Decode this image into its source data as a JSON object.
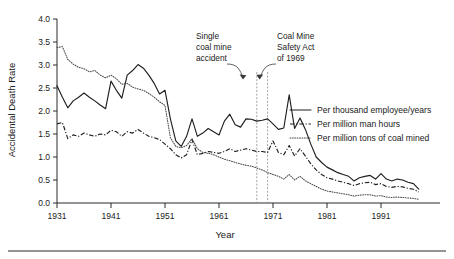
{
  "chart_data": {
    "type": "line",
    "title": "",
    "subtitle": "",
    "xlabel": "Year",
    "ylabel": "Accidental Death Rate",
    "xlim": [
      1931,
      1998
    ],
    "ylim": [
      0.0,
      4.0
    ],
    "grid": false,
    "legend_position": "center-right",
    "x_ticks": [
      1931,
      1941,
      1951,
      1961,
      1971,
      1981,
      1991
    ],
    "x_tick_labels": [
      "1931",
      "1941",
      "1951",
      "1961",
      "1971",
      "1981",
      "1991"
    ],
    "y_ticks": [
      0.0,
      0.5,
      1.0,
      1.5,
      2.0,
      2.5,
      3.0,
      3.5,
      4.0
    ],
    "y_tick_labels": [
      "0.0",
      "0.5",
      "1.0",
      "1.5",
      "2.0",
      "2.5",
      "3.0",
      "3.5",
      "4.0"
    ],
    "x": [
      1931,
      1932,
      1933,
      1934,
      1935,
      1936,
      1937,
      1938,
      1939,
      1940,
      1941,
      1942,
      1943,
      1944,
      1945,
      1946,
      1947,
      1948,
      1949,
      1950,
      1951,
      1952,
      1953,
      1954,
      1955,
      1956,
      1957,
      1958,
      1959,
      1960,
      1961,
      1962,
      1963,
      1964,
      1965,
      1966,
      1967,
      1968,
      1969,
      1970,
      1971,
      1972,
      1973,
      1974,
      1975,
      1976,
      1977,
      1978,
      1979,
      1980,
      1981,
      1982,
      1983,
      1984,
      1985,
      1986,
      1987,
      1988,
      1989,
      1990,
      1991,
      1992,
      1993,
      1994,
      1995,
      1996,
      1997,
      1998
    ],
    "series": [
      {
        "name": "Per thousand employee/years",
        "style": "solid",
        "values": [
          2.55,
          2.3,
          2.07,
          2.22,
          2.3,
          2.39,
          2.3,
          2.22,
          2.13,
          2.05,
          2.65,
          2.45,
          2.28,
          2.78,
          2.88,
          3.01,
          2.93,
          2.78,
          2.6,
          2.37,
          2.45,
          1.83,
          1.35,
          1.23,
          1.45,
          1.83,
          1.45,
          1.52,
          1.62,
          1.55,
          1.48,
          1.78,
          1.93,
          1.7,
          1.65,
          1.83,
          1.82,
          1.78,
          1.8,
          1.83,
          1.72,
          1.6,
          1.63,
          2.35,
          1.62,
          1.85,
          1.6,
          1.28,
          1.0,
          0.88,
          0.78,
          0.72,
          0.66,
          0.62,
          0.58,
          0.48,
          0.55,
          0.58,
          0.6,
          0.52,
          0.64,
          0.52,
          0.48,
          0.52,
          0.5,
          0.45,
          0.42,
          0.3
        ]
      },
      {
        "name": "Per million man hours",
        "style": "dashdot",
        "values": [
          1.72,
          1.75,
          1.4,
          1.48,
          1.45,
          1.52,
          1.48,
          1.45,
          1.5,
          1.48,
          1.58,
          1.55,
          1.45,
          1.55,
          1.52,
          1.6,
          1.52,
          1.45,
          1.42,
          1.38,
          1.28,
          1.18,
          1.05,
          0.98,
          1.05,
          1.38,
          1.05,
          1.08,
          1.12,
          1.1,
          1.08,
          1.12,
          1.18,
          1.12,
          1.15,
          1.18,
          1.15,
          1.12,
          1.12,
          1.1,
          1.35,
          1.1,
          1.05,
          1.25,
          1.02,
          1.18,
          1.02,
          0.85,
          0.72,
          0.62,
          0.55,
          0.52,
          0.48,
          0.45,
          0.42,
          0.38,
          0.42,
          0.44,
          0.45,
          0.4,
          0.42,
          0.36,
          0.34,
          0.36,
          0.35,
          0.32,
          0.3,
          0.24
        ]
      },
      {
        "name": "Per million tons of coal mined",
        "style": "dotted",
        "values": [
          3.38,
          3.4,
          3.12,
          3.02,
          2.95,
          2.92,
          2.85,
          2.88,
          2.78,
          2.72,
          2.78,
          2.7,
          2.58,
          2.6,
          2.52,
          2.48,
          2.45,
          2.38,
          2.3,
          2.2,
          2.12,
          1.42,
          1.23,
          1.2,
          1.25,
          1.4,
          1.18,
          1.1,
          1.08,
          1.05,
          1.0,
          0.95,
          0.92,
          0.88,
          0.85,
          0.82,
          0.8,
          0.76,
          0.72,
          0.66,
          0.62,
          0.58,
          0.52,
          0.62,
          0.5,
          0.58,
          0.48,
          0.42,
          0.36,
          0.3,
          0.26,
          0.24,
          0.22,
          0.2,
          0.18,
          0.15,
          0.17,
          0.18,
          0.18,
          0.15,
          0.16,
          0.13,
          0.12,
          0.13,
          0.12,
          0.11,
          0.1,
          0.08
        ]
      }
    ],
    "annotations": [
      {
        "name": "single-coal-mine-accident",
        "lines": [
          "Single",
          "coal mine",
          "accident"
        ],
        "points_to_year": 1968
      },
      {
        "name": "coal-mine-safety-act",
        "lines": [
          "Coal Mine",
          "Safety Act",
          "of 1969"
        ],
        "points_to_year": 1970
      }
    ],
    "vertical_markers": [
      {
        "name": "marker-1968",
        "year": 1968
      },
      {
        "name": "marker-1970",
        "year": 1970
      }
    ]
  },
  "legend": {
    "entries": [
      {
        "label": "Per thousand employee/years",
        "style": "solid"
      },
      {
        "label": "Per million man hours",
        "style": "dashdot"
      },
      {
        "label": "Per million tons of coal mined",
        "style": "dotted"
      }
    ]
  },
  "colors": {
    "ink": "#1f1f1f",
    "axis": "#2b2b2b",
    "dotted_series": "#4a4a4a",
    "marker_line": "#8a8a8a",
    "background": "#ffffff"
  }
}
